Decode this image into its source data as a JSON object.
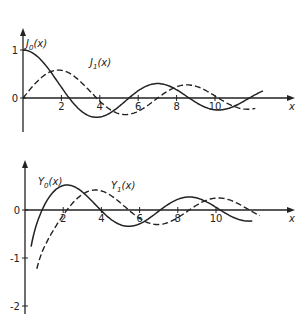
{
  "chart_data": [
    {
      "type": "line",
      "title": "",
      "xlabel": "x",
      "ylabel": "",
      "xticks": [
        2,
        4,
        6,
        8,
        10
      ],
      "yticks": [
        0,
        1
      ],
      "xlim": [
        0,
        12.6
      ],
      "ylim": [
        -0.5,
        1.2
      ],
      "grid": false,
      "legend": "inline labels near curves",
      "series": [
        {
          "name": "J0(x)",
          "label_main": "J",
          "label_sub": "0",
          "label_arg": "(x)",
          "style": "solid",
          "fn": "J0",
          "x_start": 0,
          "x_end": 12.5,
          "sample_points": [
            [
              0,
              1
            ],
            [
              2.405,
              0
            ],
            [
              3.83,
              -0.403
            ],
            [
              5.52,
              0
            ],
            [
              7.02,
              0.3
            ],
            [
              8.65,
              0
            ],
            [
              10.17,
              -0.25
            ],
            [
              11.79,
              0
            ]
          ]
        },
        {
          "name": "J1(x)",
          "label_main": "J",
          "label_sub": "1",
          "label_arg": "(x)",
          "style": "dashed",
          "fn": "J1",
          "x_start": 0,
          "x_end": 12.1,
          "sample_points": [
            [
              0,
              0
            ],
            [
              1.84,
              0.582
            ],
            [
              3.83,
              0
            ],
            [
              5.33,
              -0.346
            ],
            [
              7.02,
              0
            ],
            [
              8.54,
              0.273
            ],
            [
              10.17,
              0
            ],
            [
              11.71,
              -0.231
            ]
          ]
        }
      ]
    },
    {
      "type": "line",
      "title": "",
      "xlabel": "x",
      "ylabel": "",
      "xticks": [
        2,
        4,
        6,
        8,
        10
      ],
      "yticks": [
        0,
        -1,
        -2
      ],
      "xlim": [
        0,
        12.6
      ],
      "ylim": [
        -2.1,
        0.7
      ],
      "grid": false,
      "legend": "inline labels near curves",
      "series": [
        {
          "name": "Y0(x)",
          "label_main": "Y",
          "label_sub": "0",
          "label_arg": "(x)",
          "style": "solid",
          "fn": "Y0",
          "x_start": 0.32,
          "x_end": 11.9,
          "sample_points": [
            [
              0.89,
              0
            ],
            [
              2.2,
              0.52
            ],
            [
              3.96,
              0
            ],
            [
              5.43,
              -0.34
            ],
            [
              7.09,
              0
            ],
            [
              8.6,
              0.28
            ],
            [
              10.22,
              0
            ]
          ]
        },
        {
          "name": "Y1(x)",
          "label_main": "Y",
          "label_sub": "1",
          "label_arg": "(x)",
          "style": "dashed",
          "fn": "Y1",
          "x_start": 0.62,
          "x_end": 12.3,
          "sample_points": [
            [
              2.2,
              0
            ],
            [
              3.68,
              0.42
            ],
            [
              5.43,
              0
            ],
            [
              6.94,
              -0.3
            ],
            [
              8.6,
              0
            ],
            [
              10.02,
              0.25
            ],
            [
              11.79,
              0
            ]
          ]
        }
      ]
    }
  ],
  "panels": [
    {
      "origin_px": [
        23,
        98
      ],
      "x_scale": 19.2,
      "y_scale": 48,
      "axis_top": 28,
      "axis_bottom": 132,
      "axis_right": 295,
      "ylabels": [
        {
          "text": "1",
          "v": 1
        },
        {
          "text": "0",
          "v": 0
        }
      ],
      "xlabels": [
        "2",
        "4",
        "6",
        "8",
        "10"
      ],
      "axis_var": "x",
      "label_pos": [
        [
          26,
          47
        ],
        [
          90,
          66
        ]
      ]
    },
    {
      "origin_px": [
        25,
        210
      ],
      "x_scale": 19.1,
      "y_scale": 48,
      "axis_top": 160,
      "axis_bottom": 314,
      "axis_right": 295,
      "ylabels": [
        {
          "text": "0",
          "v": 0
        },
        {
          "text": "-1",
          "v": -1
        },
        {
          "text": "-2",
          "v": -2
        }
      ],
      "xlabels": [
        "2",
        "4",
        "6",
        "8",
        "10"
      ],
      "axis_var": "x",
      "label_pos": [
        [
          38,
          185
        ],
        [
          111,
          189
        ]
      ]
    }
  ]
}
